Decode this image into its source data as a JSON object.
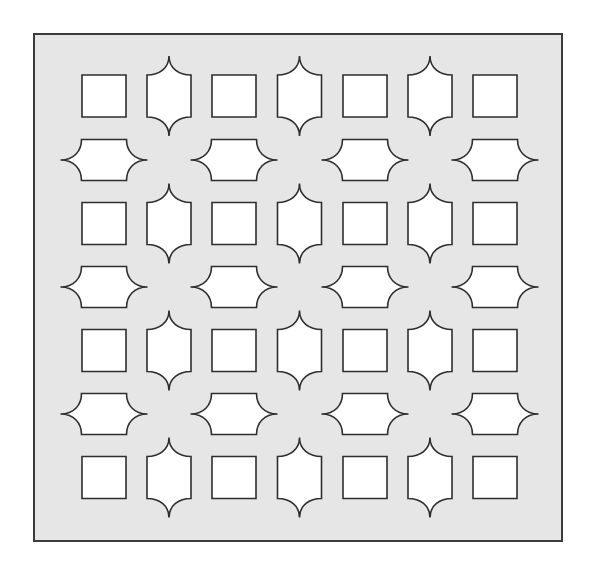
{
  "figure": {
    "canvas": {
      "width": 591,
      "height": 572
    },
    "colors": {
      "background": "#ffffff",
      "panel_fill": "#e6e6e6",
      "panel_stroke": "#3c3c3c",
      "cutout_fill": "#ffffff",
      "cutout_stroke": "#2e2e2e"
    },
    "panel": {
      "x": 34,
      "y": 34,
      "width": 528,
      "height": 507
    },
    "grid": {
      "rows": 7,
      "cols": 7,
      "col_centers": [
        104,
        169,
        234,
        299.5,
        365,
        430,
        495
      ],
      "row_centers": [
        96,
        160,
        223.5,
        287,
        350.5,
        414,
        477.5
      ]
    },
    "shape_sizes": {
      "square": {
        "width": 44,
        "height": 42
      },
      "vertical_ogee": {
        "body_width": 44,
        "body_height": 42,
        "tip_extent": 19
      },
      "horizontal_ogee": {
        "body_width": 45,
        "body_height": 41,
        "tip_extent": 21
      }
    },
    "layout": [
      [
        "square",
        "vertical",
        "square",
        "vertical",
        "square",
        "vertical",
        "square"
      ],
      [
        "horizontal",
        "empty",
        "horizontal",
        "empty",
        "horizontal",
        "empty",
        "horizontal"
      ],
      [
        "square",
        "vertical",
        "square",
        "vertical",
        "square",
        "vertical",
        "square"
      ],
      [
        "horizontal",
        "empty",
        "horizontal",
        "empty",
        "horizontal",
        "empty",
        "horizontal"
      ],
      [
        "square",
        "vertical",
        "square",
        "vertical",
        "square",
        "vertical",
        "square"
      ],
      [
        "horizontal",
        "empty",
        "horizontal",
        "empty",
        "horizontal",
        "empty",
        "horizontal"
      ],
      [
        "square",
        "vertical",
        "square",
        "vertical",
        "square",
        "vertical",
        "square"
      ]
    ],
    "counts": {
      "squares": 16,
      "vertical_ogee_shapes": 12,
      "horizontal_ogee_shapes": 12
    }
  }
}
